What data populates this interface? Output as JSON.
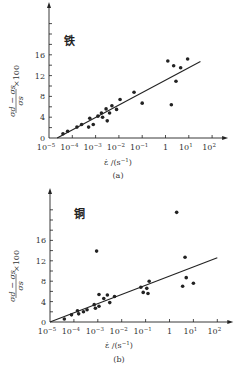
{
  "chart_data": [
    {
      "type": "scatter",
      "panel": "(a)",
      "material_label": "铁",
      "title": "",
      "xlabel": "ε̇/(s⁻¹)",
      "ylabel": "(σd − σs)/σs × 100",
      "xscale": "log",
      "xlim": [
        1e-05,
        100.0
      ],
      "ylim": [
        0,
        24
      ],
      "x_tick_labels": [
        "10⁻⁵",
        "10⁻⁴",
        "10⁻³",
        "10⁻²",
        "10⁻¹",
        "1",
        "10¹",
        "10²"
      ],
      "y_tick_labels": [
        "0",
        "4",
        "8",
        "12",
        "16"
      ],
      "points": [
        {
          "log10x": -4.4,
          "y": 0.8
        },
        {
          "log10x": -4.2,
          "y": 1.3
        },
        {
          "log10x": -3.8,
          "y": 2.1
        },
        {
          "log10x": -3.6,
          "y": 2.6
        },
        {
          "log10x": -3.3,
          "y": 2.1
        },
        {
          "log10x": -3.25,
          "y": 3.8
        },
        {
          "log10x": -3.1,
          "y": 2.6
        },
        {
          "log10x": -2.9,
          "y": 4.2
        },
        {
          "log10x": -2.75,
          "y": 4.8
        },
        {
          "log10x": -2.7,
          "y": 4.0
        },
        {
          "log10x": -2.55,
          "y": 5.6
        },
        {
          "log10x": -2.5,
          "y": 3.3
        },
        {
          "log10x": -2.4,
          "y": 4.8
        },
        {
          "log10x": -2.3,
          "y": 6.2
        },
        {
          "log10x": -2.1,
          "y": 5.5
        },
        {
          "log10x": -1.95,
          "y": 7.4
        },
        {
          "log10x": -1.35,
          "y": 8.8
        },
        {
          "log10x": -1.0,
          "y": 6.7
        },
        {
          "log10x": 0.1,
          "y": 14.8
        },
        {
          "log10x": 0.25,
          "y": 6.4
        },
        {
          "log10x": 0.35,
          "y": 13.9
        },
        {
          "log10x": 0.45,
          "y": 10.9
        },
        {
          "log10x": 0.65,
          "y": 13.5
        },
        {
          "log10x": 0.95,
          "y": 15.2
        }
      ],
      "fit_line": {
        "from": {
          "log10x": -4.65,
          "y": 0
        },
        "to": {
          "log10x": 1.5,
          "y": 14.7
        }
      },
      "caption": "(a)"
    },
    {
      "type": "scatter",
      "panel": "(b)",
      "material_label": "铜",
      "title": "",
      "xlabel": "ε̇/(s⁻¹)",
      "ylabel": "(σd − σs)/σs × 100",
      "xscale": "log",
      "xlim": [
        1e-05,
        100.0
      ],
      "ylim": [
        0,
        24
      ],
      "x_tick_labels": [
        "10⁻⁵",
        "10⁻⁴",
        "10⁻³",
        "10⁻²",
        "10⁻¹",
        "1",
        "10¹",
        "10²"
      ],
      "y_tick_labels": [
        "0",
        "4",
        "8",
        "12",
        "16"
      ],
      "points": [
        {
          "log10x": -4.4,
          "y": 0.6
        },
        {
          "log10x": -4.1,
          "y": 1.4
        },
        {
          "log10x": -3.85,
          "y": 2.2
        },
        {
          "log10x": -3.8,
          "y": 1.6
        },
        {
          "log10x": -3.6,
          "y": 2.0
        },
        {
          "log10x": -3.45,
          "y": 2.4
        },
        {
          "log10x": -3.15,
          "y": 3.4
        },
        {
          "log10x": -3.1,
          "y": 2.7
        },
        {
          "log10x": -3.05,
          "y": 13.9
        },
        {
          "log10x": -2.95,
          "y": 5.4
        },
        {
          "log10x": -2.95,
          "y": 3.1
        },
        {
          "log10x": -2.75,
          "y": 4.6
        },
        {
          "log10x": -2.6,
          "y": 5.3
        },
        {
          "log10x": -2.5,
          "y": 3.8
        },
        {
          "log10x": -2.3,
          "y": 5.0
        },
        {
          "log10x": -1.2,
          "y": 6.8
        },
        {
          "log10x": -1.1,
          "y": 5.8
        },
        {
          "log10x": -0.95,
          "y": 6.6
        },
        {
          "log10x": -0.9,
          "y": 5.6
        },
        {
          "log10x": -0.85,
          "y": 8.0
        },
        {
          "log10x": 0.3,
          "y": 21.5
        },
        {
          "log10x": 0.55,
          "y": 7.0
        },
        {
          "log10x": 0.65,
          "y": 12.7
        },
        {
          "log10x": 0.7,
          "y": 8.7
        },
        {
          "log10x": 1.0,
          "y": 7.6
        }
      ],
      "fit_line": {
        "from": {
          "log10x": -5.0,
          "y": 0
        },
        "to": {
          "log10x": 2.0,
          "y": 12.6
        }
      },
      "caption": "(b)"
    }
  ],
  "panels": [
    {
      "material": "铁",
      "caption": "(a)",
      "y_ticks": [
        "0",
        "4",
        "8",
        "12",
        "16"
      ],
      "x_ticks": [
        {
          "base": "10",
          "exp": "−5"
        },
        {
          "base": "10",
          "exp": "−4"
        },
        {
          "base": "10",
          "exp": "−3"
        },
        {
          "base": "10",
          "exp": "−2"
        },
        {
          "base": "10",
          "exp": "−1"
        },
        {
          "base": "1",
          "exp": ""
        },
        {
          "base": "10",
          "exp": "1"
        },
        {
          "base": "10",
          "exp": "2"
        }
      ],
      "xlabel_main": "ε̇ /(s",
      "xlabel_exp": "−1",
      "xlabel_end": ")",
      "ylabel_num": "σd − σs",
      "ylabel_den": "σs",
      "ylabel_mult": "×100"
    },
    {
      "material": "铜",
      "caption": "(b)",
      "y_ticks": [
        "0",
        "4",
        "8",
        "12",
        "16"
      ],
      "x_ticks": [
        {
          "base": "10",
          "exp": "−5"
        },
        {
          "base": "10",
          "exp": "−4"
        },
        {
          "base": "10",
          "exp": "−3"
        },
        {
          "base": "10",
          "exp": "−2"
        },
        {
          "base": "10",
          "exp": "−1"
        },
        {
          "base": "1",
          "exp": ""
        },
        {
          "base": "10",
          "exp": "1"
        },
        {
          "base": "10",
          "exp": "2"
        }
      ],
      "xlabel_main": "ε̇ /(s",
      "xlabel_exp": "−1",
      "xlabel_end": ")",
      "ylabel_num": "σd − σs",
      "ylabel_den": "σs",
      "ylabel_mult": "×100"
    }
  ],
  "colors": {
    "ink": "#222222",
    "background": "#ffffff"
  }
}
